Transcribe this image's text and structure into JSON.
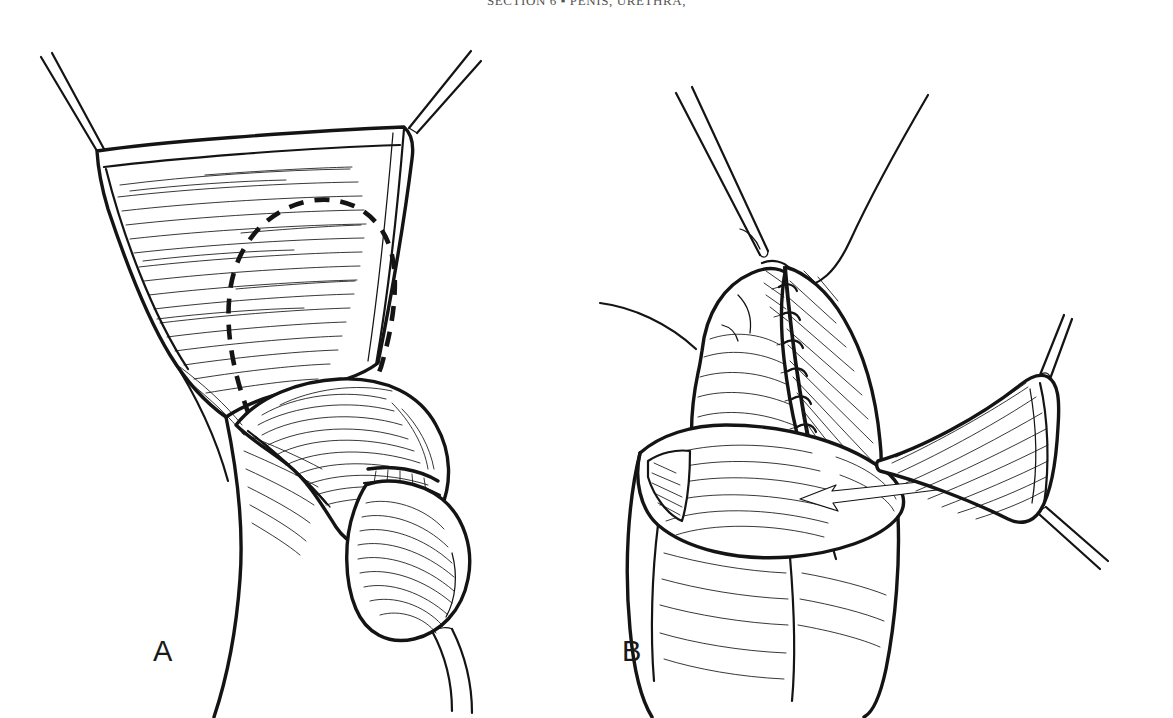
{
  "page": {
    "width": 1173,
    "height": 718,
    "background_color": "#ffffff",
    "ink_color": "#141414",
    "media": "scanned book page, pen-and-ink line illustration"
  },
  "header": {
    "running_head": "SECTION 6  ▪  PENIS, URETHRA,",
    "running_head_visible_fragment": "SECTION 6 — PENIS, URETHRA,",
    "clipped": "true",
    "rule_present": "true"
  },
  "figure": {
    "caption_present": "false",
    "panels": [
      {
        "id": "A",
        "label": "A",
        "position": "left",
        "description": "Penile shaft with skin retracted by traction sutures; dashed U-shaped outline marks the planned island flap on the hatched inner preputial/shaft skin; glans and catheter visible below.",
        "annotations": [
          {
            "name": "dashed-incision-outline",
            "type": "dashed-line",
            "meaning": "planned flap incision"
          },
          {
            "name": "traction-suture-upper-left",
            "type": "suture",
            "meaning": "skin retraction"
          },
          {
            "name": "traction-suture-upper-right",
            "type": "suture",
            "meaning": "skin retraction"
          },
          {
            "name": "catheter",
            "type": "instrument",
            "meaning": "urethral catheter exiting meatus"
          }
        ]
      },
      {
        "id": "B",
        "label": "B",
        "position": "right",
        "description": "Flap raised and transposed; interrupted sutures close the longitudinal suture line; a long arrow indicates the direction the pedicled flap is advanced. Forceps and suture threads at the apex; traction sutures at the free flap corners.",
        "annotations": [
          {
            "name": "interrupted-suture-line",
            "type": "sutures",
            "meaning": "closure of flap to urethral plate"
          },
          {
            "name": "advancement-arrow",
            "type": "arrow",
            "direction": "left",
            "meaning": "direction of flap transposition"
          },
          {
            "name": "forceps",
            "type": "instrument",
            "meaning": "tissue forceps holding apex"
          },
          {
            "name": "suture-thread",
            "type": "suture",
            "meaning": "free suture tails"
          },
          {
            "name": "traction-suture-flap-tip-upper",
            "type": "suture",
            "meaning": "flap corner traction"
          },
          {
            "name": "traction-suture-flap-tip-lower",
            "type": "suture",
            "meaning": "flap corner traction"
          }
        ]
      }
    ]
  }
}
